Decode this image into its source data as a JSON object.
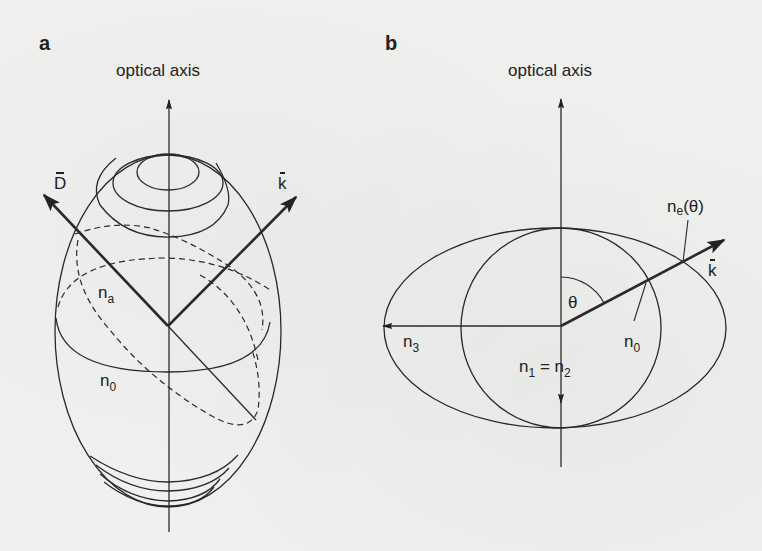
{
  "figure": {
    "panels": [
      {
        "id": "a",
        "letter": "a",
        "axis_label": "optical axis",
        "vector_D": "D",
        "vector_k": "k",
        "label_na_main": "n",
        "label_na_sub": "a",
        "label_n0_main": "n",
        "label_n0_sub": "0"
      },
      {
        "id": "b",
        "letter": "b",
        "axis_label": "optical axis",
        "label_ne_main": "n",
        "label_ne_sub": "e",
        "label_ne_arg": "(θ)",
        "vector_k": "k",
        "theta": "θ",
        "label_n3_main": "n",
        "label_n3_sub": "3",
        "label_n0_main": "n",
        "label_n0_sub": "0",
        "label_n12_main1": "n",
        "label_n12_sub1": "1",
        "label_n12_eq": " = ",
        "label_n12_main2": "n",
        "label_n12_sub2": "2"
      }
    ],
    "colors": {
      "ink": "#222222",
      "paper": "#f0f0ee"
    }
  }
}
